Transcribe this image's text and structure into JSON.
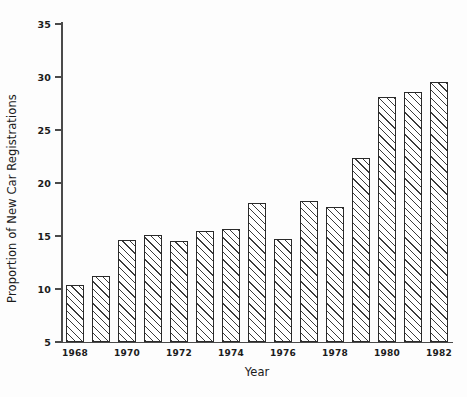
{
  "chart_data": {
    "type": "bar",
    "title": "",
    "xlabel": "Year",
    "ylabel": "Proportion of New Car Registrations",
    "categories": [
      1968,
      1969,
      1970,
      1971,
      1972,
      1973,
      1974,
      1975,
      1976,
      1977,
      1978,
      1979,
      1980,
      1981,
      1982
    ],
    "values": [
      10.4,
      11.2,
      14.6,
      15.1,
      14.5,
      15.5,
      15.7,
      18.1,
      14.7,
      18.3,
      17.7,
      22.4,
      28.1,
      28.6,
      29.5
    ],
    "ylim": [
      5,
      35
    ],
    "yticks": [
      5,
      10,
      15,
      20,
      25,
      30,
      35
    ],
    "ytick_labels": [
      "5",
      "10",
      "15",
      "20",
      "25",
      "30",
      "35"
    ],
    "xtick_labels": [
      "1968",
      "1970",
      "1972",
      "1974",
      "1976",
      "1978",
      "1980",
      "1982"
    ],
    "xticks": [
      1968,
      1970,
      1972,
      1974,
      1976,
      1978,
      1980,
      1982
    ],
    "grid": false,
    "legend": null,
    "bar_style": {
      "fill": "diagonal-hatch",
      "edge_color": "#2a2a2a",
      "hatch_color": "#3b3b3b",
      "background_color": "#ffffff"
    },
    "axis_color": "#4a4a4a",
    "text_color": "#1b1b1b"
  }
}
